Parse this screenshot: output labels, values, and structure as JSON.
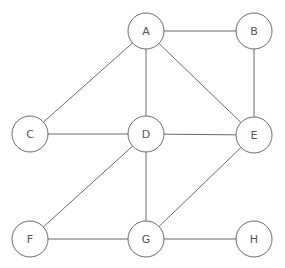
{
  "diagram": {
    "type": "undirected-graph",
    "nodes": [
      {
        "id": "A",
        "label": "A"
      },
      {
        "id": "B",
        "label": "B"
      },
      {
        "id": "C",
        "label": "C"
      },
      {
        "id": "D",
        "label": "D"
      },
      {
        "id": "E",
        "label": "E"
      },
      {
        "id": "F",
        "label": "F"
      },
      {
        "id": "G",
        "label": "G"
      },
      {
        "id": "H",
        "label": "H"
      }
    ],
    "edges": [
      [
        "A",
        "B"
      ],
      [
        "A",
        "C"
      ],
      [
        "A",
        "D"
      ],
      [
        "A",
        "E"
      ],
      [
        "B",
        "E"
      ],
      [
        "C",
        "D"
      ],
      [
        "D",
        "E"
      ],
      [
        "D",
        "F"
      ],
      [
        "D",
        "G"
      ],
      [
        "E",
        "G"
      ],
      [
        "F",
        "G"
      ],
      [
        "G",
        "H"
      ]
    ]
  }
}
